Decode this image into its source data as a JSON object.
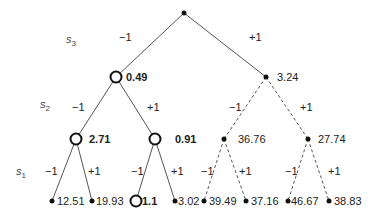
{
  "diagram": {
    "type": "binary-tree",
    "levels": [
      {
        "var": "s",
        "sub": "3",
        "y": 40
      },
      {
        "var": "s",
        "sub": "2",
        "y": 105
      },
      {
        "var": "s",
        "sub": "1",
        "y": 172
      }
    ],
    "edge_labels": {
      "minus": "−1",
      "plus": "+1"
    },
    "nodes": {
      "root": {
        "x": 184,
        "y": 13,
        "style": "dot",
        "value": ""
      },
      "n_l": {
        "x": 116,
        "y": 77,
        "style": "circle",
        "value": "0.49",
        "bold": true
      },
      "n_r": {
        "x": 266,
        "y": 77,
        "style": "dot",
        "value": "3.24",
        "bold": false
      },
      "n_ll": {
        "x": 76,
        "y": 139,
        "style": "circle",
        "value": "2.71",
        "bold": true
      },
      "n_lr": {
        "x": 155,
        "y": 139,
        "style": "circle",
        "value": "0.91",
        "bold": true
      },
      "n_rl": {
        "x": 224,
        "y": 139,
        "style": "dot",
        "value": "36.76",
        "bold": false
      },
      "n_rr": {
        "x": 308,
        "y": 139,
        "style": "dot",
        "value": "27.74",
        "bold": false
      },
      "leaf_1": {
        "x": 52,
        "y": 201,
        "style": "dot",
        "value": "12.51"
      },
      "leaf_2": {
        "x": 92,
        "y": 201,
        "style": "dot",
        "value": "19.93"
      },
      "leaf_3": {
        "x": 136,
        "y": 201,
        "style": "circle",
        "value": "1.1",
        "bold": true
      },
      "leaf_4": {
        "x": 175,
        "y": 201,
        "style": "dot",
        "value": "3.02"
      },
      "leaf_5": {
        "x": 204,
        "y": 201,
        "style": "dot",
        "value": "39.49"
      },
      "leaf_6": {
        "x": 246,
        "y": 201,
        "style": "dot",
        "value": "37.16"
      },
      "leaf_7": {
        "x": 288,
        "y": 201,
        "style": "dot",
        "value": "46.67"
      },
      "leaf_8": {
        "x": 329,
        "y": 201,
        "style": "dot",
        "value": "38.83"
      }
    },
    "colors": {
      "line": "#555555",
      "node": "#111111",
      "text": "#222222"
    }
  }
}
